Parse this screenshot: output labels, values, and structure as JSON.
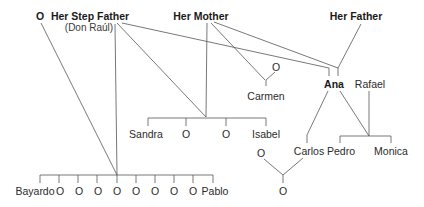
{
  "diagram": {
    "type": "family-tree",
    "line_color": "#555555",
    "text_color": "#2b2b2b",
    "nodes": {
      "unknown_top_left": "O",
      "step_father": "Her Step Father",
      "step_father_name": "(Don Raúl)",
      "mother": "Her Mother",
      "father": "Her Father",
      "carmen_partner": "O",
      "carmen": "Carmen",
      "ana": "Ana",
      "rafael": "Rafael",
      "half_siblings": [
        "Sandra",
        "O",
        "O",
        "Isabel"
      ],
      "step_siblings": [
        "Bayardo",
        "O",
        "O",
        "O",
        "O",
        "O",
        "O",
        "O",
        "O",
        "Pablo"
      ],
      "carlos": "Carlos",
      "pedro": "Pedro",
      "monica": "Monica",
      "carlos_partner": "O",
      "carlos_child": "O"
    }
  }
}
